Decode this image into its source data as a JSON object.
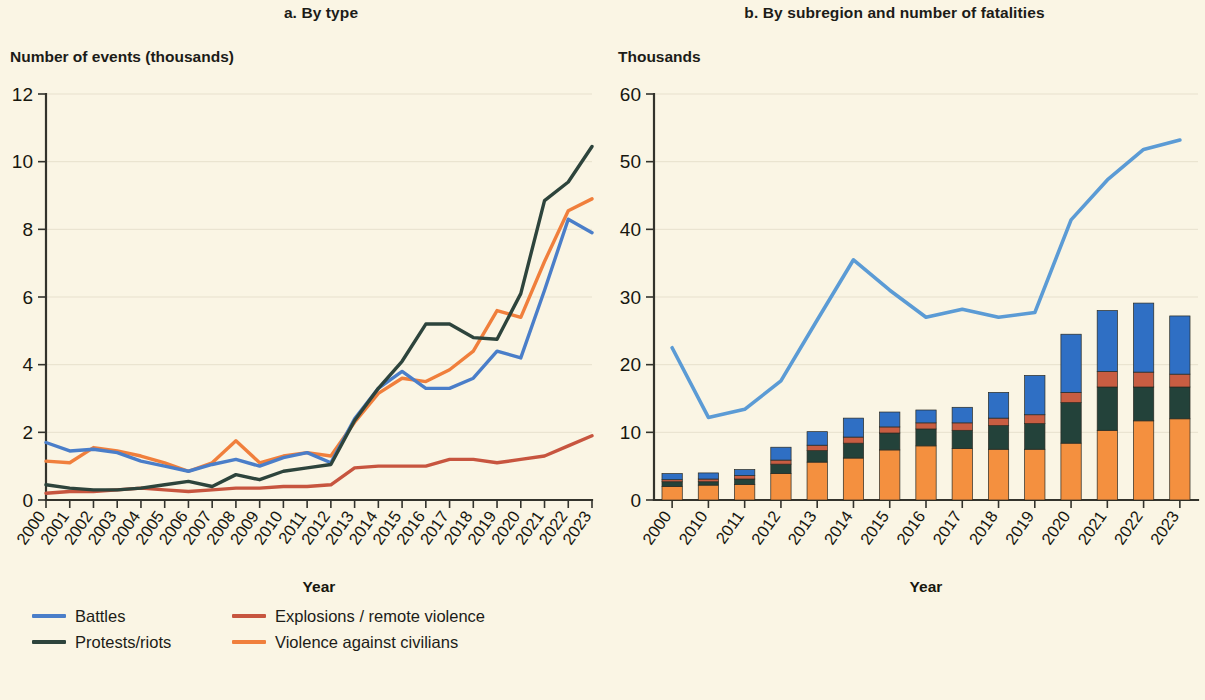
{
  "figure": {
    "background_color": "#faf5e4",
    "text_color": "#17170f"
  },
  "panel_a": {
    "title": "a. By type",
    "axis_unit": "Number of events (thousands)",
    "xlabel": "Year"
  },
  "panel_b": {
    "title": "b. By subregion and number of fatalities",
    "axis_unit": "Thousands",
    "xlabel": "Year"
  },
  "legend_a": {
    "items": [
      {
        "label": "Battles",
        "color": "#4a7ec9",
        "marker": "line"
      },
      {
        "label": "Explosions / remote violence",
        "color": "#c7553f",
        "marker": "line"
      },
      {
        "label": "Protests/riots",
        "color": "#2d443c",
        "marker": "line"
      },
      {
        "label": "Violence against civilians",
        "color": "#f07f3c",
        "marker": "line"
      }
    ]
  },
  "legend_b": {
    "items": [
      {
        "label": "Western Africa",
        "color": "#2f6fc4",
        "marker": "box"
      },
      {
        "label": "Southern Africa",
        "color": "#c85d42",
        "marker": "box"
      },
      {
        "label": "Central Africa",
        "color": "#23423a",
        "marker": "box"
      },
      {
        "label": "Eastern Africa",
        "color": "#f4903f",
        "marker": "box"
      }
    ],
    "total_line": {
      "label": "Total number of fatalities",
      "color": "#5b9bd5",
      "marker": "line"
    }
  },
  "chart_data": [
    {
      "type": "line",
      "id": "panel-a",
      "title": "a. By type",
      "xlabel": "Year",
      "ylabel": "Number of events (thousands)",
      "ylim": [
        0,
        12
      ],
      "yticks": [
        0,
        2,
        4,
        6,
        8,
        10,
        12
      ],
      "grid": true,
      "legend_position": "bottom-left",
      "categories": [
        "2000",
        "2001",
        "2002",
        "2003",
        "2004",
        "2005",
        "2006",
        "2007",
        "2008",
        "2009",
        "2010",
        "2011",
        "2012",
        "2013",
        "2014",
        "2015",
        "2016",
        "2017",
        "2018",
        "2019",
        "2020",
        "2021",
        "2022",
        "2023"
      ],
      "series": [
        {
          "name": "Battles",
          "color": "#4a7ec9",
          "values": [
            1.7,
            1.45,
            1.5,
            1.4,
            1.15,
            1.0,
            0.85,
            1.05,
            1.2,
            1.0,
            1.25,
            1.4,
            1.1,
            2.4,
            3.3,
            3.8,
            3.3,
            3.3,
            3.6,
            4.4,
            4.2,
            6.2,
            8.3,
            7.9,
            8.5
          ]
        },
        {
          "name": "Explosions / remote violence",
          "color": "#c7553f",
          "values": [
            0.2,
            0.25,
            0.25,
            0.3,
            0.35,
            0.3,
            0.25,
            0.3,
            0.35,
            0.35,
            0.4,
            0.4,
            0.45,
            0.95,
            1.0,
            1.0,
            1.0,
            1.2,
            1.2,
            1.1,
            1.2,
            1.3,
            1.6,
            1.9,
            2.35
          ]
        },
        {
          "name": "Protests/riots",
          "color": "#2d443c",
          "values": [
            0.45,
            0.35,
            0.3,
            0.3,
            0.35,
            0.45,
            0.55,
            0.4,
            0.75,
            0.6,
            0.85,
            0.95,
            1.05,
            2.35,
            3.3,
            4.1,
            5.2,
            5.2,
            4.8,
            4.75,
            6.1,
            8.85,
            9.4,
            10.45,
            8.6
          ]
        },
        {
          "name": "Violence against civilians",
          "color": "#f07f3c",
          "values": [
            1.15,
            1.1,
            1.55,
            1.45,
            1.3,
            1.1,
            0.85,
            1.1,
            1.75,
            1.1,
            1.3,
            1.4,
            1.3,
            2.3,
            3.15,
            3.6,
            3.5,
            3.85,
            4.4,
            5.6,
            5.4,
            7.05,
            8.55,
            8.9,
            7.6
          ]
        }
      ]
    },
    {
      "type": "bar",
      "id": "panel-b",
      "title": "b. By subregion and number of fatalities",
      "xlabel": "Year",
      "ylabel": "Thousands",
      "ylim": [
        0,
        60
      ],
      "yticks": [
        0,
        10,
        20,
        30,
        40,
        50,
        60
      ],
      "grid": true,
      "stacked": true,
      "legend_position": "bottom-right",
      "categories": [
        "2000",
        "2010",
        "2011",
        "2012",
        "2013",
        "2014",
        "2015",
        "2016",
        "2017",
        "2018",
        "2019",
        "2020",
        "2021",
        "2022",
        "2023"
      ],
      "series": [
        {
          "name": "Eastern Africa",
          "color": "#f4903f",
          "values": [
            2.0,
            2.2,
            2.3,
            3.9,
            5.6,
            6.2,
            7.4,
            8.0,
            7.6,
            7.5,
            7.5,
            8.4,
            10.3,
            11.7,
            12.0
          ]
        },
        {
          "name": "Central Africa",
          "color": "#23423a",
          "values": [
            0.7,
            0.5,
            0.8,
            1.4,
            1.7,
            2.2,
            2.5,
            2.5,
            2.7,
            3.5,
            3.8,
            6.0,
            6.4,
            5.0,
            4.7
          ]
        },
        {
          "name": "Southern Africa",
          "color": "#c85d42",
          "values": [
            0.3,
            0.4,
            0.5,
            0.6,
            0.8,
            0.9,
            0.9,
            0.9,
            1.1,
            1.1,
            1.3,
            1.5,
            2.3,
            2.2,
            1.9
          ]
        },
        {
          "name": "Western Africa",
          "color": "#2f6fc4",
          "values": [
            0.9,
            0.9,
            0.9,
            1.9,
            2.0,
            2.8,
            2.2,
            1.9,
            2.3,
            3.8,
            5.8,
            8.6,
            9.0,
            10.2,
            8.6
          ]
        }
      ],
      "overlay_line": {
        "name": "Total number of fatalities",
        "color": "#5b9bd5",
        "values": [
          22.5,
          12.2,
          13.4,
          17.6,
          26.6,
          35.5,
          31.0,
          27.0,
          28.2,
          27.0,
          27.7,
          41.4,
          47.3,
          51.8,
          53.2
        ]
      }
    }
  ]
}
